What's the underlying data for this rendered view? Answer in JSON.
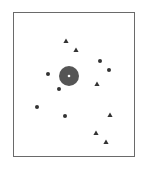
{
  "diagram": {
    "frame": {
      "x": 13,
      "y": 12,
      "width": 122,
      "height": 145,
      "stroke": "#6a6a6a"
    },
    "center_marker": {
      "x": 69,
      "y": 76,
      "r": 10,
      "fill": "#555555",
      "dot_fill": "#ffffff",
      "dot_r": 1.3
    },
    "marker_color": "#333333",
    "circles": [
      {
        "x": 100,
        "y": 61
      },
      {
        "x": 109,
        "y": 70
      },
      {
        "x": 48,
        "y": 74
      },
      {
        "x": 59,
        "y": 89
      },
      {
        "x": 37,
        "y": 107
      },
      {
        "x": 65,
        "y": 116
      }
    ],
    "triangles": [
      {
        "x": 66,
        "y": 41
      },
      {
        "x": 76,
        "y": 50
      },
      {
        "x": 97,
        "y": 84
      },
      {
        "x": 110,
        "y": 115
      },
      {
        "x": 96,
        "y": 133
      },
      {
        "x": 106,
        "y": 142
      }
    ]
  }
}
